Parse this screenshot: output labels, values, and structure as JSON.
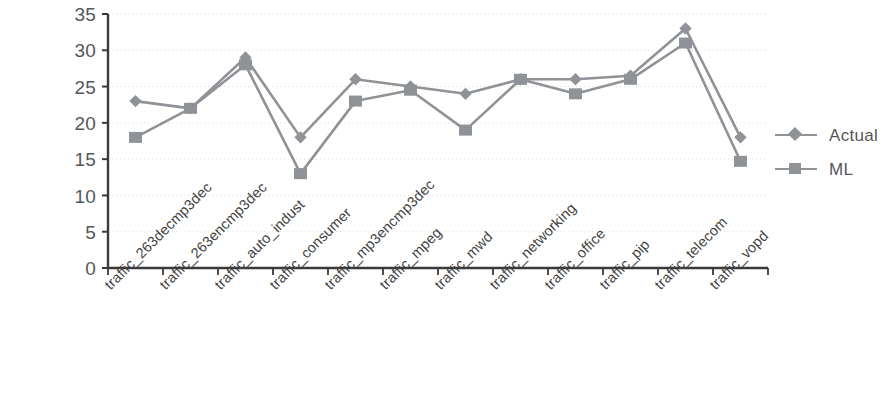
{
  "chart_data": {
    "type": "line",
    "title": "",
    "subtitle": "",
    "xlabel": "",
    "ylabel": "",
    "ylim": [
      0,
      35
    ],
    "y_ticks": [
      0,
      5,
      10,
      15,
      20,
      25,
      30,
      35
    ],
    "grid": true,
    "grid_axis": "y",
    "legend_position": "right",
    "categories": [
      "traffic_263decmp3dec",
      "traffic_263encmp3dec",
      "traffic_auto_indust",
      "traffic_consumer",
      "traffic_mp3encmp3dec",
      "traffic_mpeg",
      "traffic_mwd",
      "traffic_networking",
      "traffic_office",
      "traffic_pip",
      "traffic_telecom",
      "traffic_vopd"
    ],
    "series": [
      {
        "name": "Actual",
        "marker": "diamond",
        "color": "#8f9296",
        "values": [
          23,
          22,
          29,
          18,
          26,
          25,
          24,
          26,
          26,
          26.5,
          33,
          18
        ]
      },
      {
        "name": "ML",
        "marker": "square",
        "color": "#8f9296",
        "values": [
          18,
          22,
          28,
          13,
          23,
          24.5,
          19,
          26,
          24,
          26,
          31,
          14.7
        ]
      }
    ]
  },
  "axes": {
    "y_tick_labels": [
      "35",
      "30",
      "25",
      "20",
      "15",
      "10",
      "5",
      "0"
    ],
    "axis_color": "#3a3a3a",
    "grid_color": "#dcdcdc"
  },
  "legend": {
    "entries": [
      {
        "label": "Actual",
        "marker": "diamond-marker-icon"
      },
      {
        "label": "ML",
        "marker": "square-marker-icon"
      }
    ]
  }
}
